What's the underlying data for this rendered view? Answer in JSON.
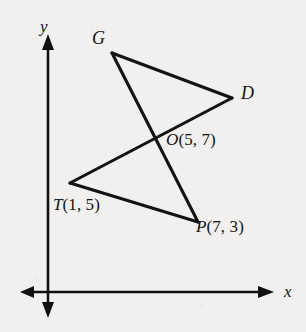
{
  "figure": {
    "kind": "coordinate-geometry-diagram",
    "background_color": "#f1f0ee",
    "ink_color": "#131313"
  },
  "axes": {
    "x_label": "x",
    "y_label": "y",
    "x_axis": {
      "y_px": 292,
      "x_start_px": 20,
      "x_end_px": 272,
      "arrows": "both"
    },
    "y_axis": {
      "x_px": 48,
      "y_start_px": 35,
      "y_end_px": 316,
      "arrows": "both"
    }
  },
  "points": [
    {
      "id": "G",
      "name": "G",
      "label": "G",
      "has_coords": false,
      "x_px": 112,
      "y_px": 53
    },
    {
      "id": "D",
      "name": "D",
      "label": "D",
      "has_coords": false,
      "x_px": 232,
      "y_px": 98
    },
    {
      "id": "O",
      "name": "O",
      "label": "O",
      "has_coords": true,
      "coord_x": 5,
      "coord_y": 7,
      "coord_text": "(5, 7)",
      "x_px": 155,
      "y_px": 142
    },
    {
      "id": "T",
      "name": "T",
      "label": "T",
      "has_coords": true,
      "coord_x": 1,
      "coord_y": 5,
      "coord_text": "(1, 5)",
      "x_px": 70,
      "y_px": 183
    },
    {
      "id": "P",
      "name": "P",
      "label": "P",
      "has_coords": true,
      "coord_x": 7,
      "coord_y": 3,
      "coord_text": "(7, 3)",
      "x_px": 198,
      "y_px": 222
    }
  ],
  "segments": [
    {
      "id": "GP",
      "from": "G",
      "to": "P",
      "label": "GP"
    },
    {
      "id": "TD",
      "from": "T",
      "to": "D",
      "label": "TD"
    },
    {
      "id": "GD",
      "from": "G",
      "to": "D",
      "label": "GD"
    },
    {
      "id": "TP",
      "from": "T",
      "to": "P",
      "label": "TP"
    }
  ],
  "labels": {
    "y_axis": "y",
    "x_axis": "x",
    "G": "G",
    "D": "D",
    "O_name": "O",
    "O_coords": "(5, 7)",
    "T_name": "T",
    "T_coords": "(1, 5)",
    "P_name": "P",
    "P_coords": "(7, 3)"
  }
}
